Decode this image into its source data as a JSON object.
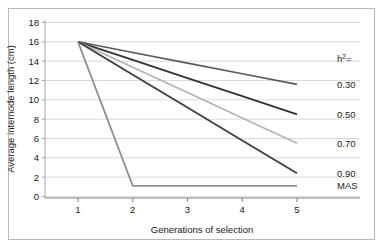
{
  "chart_data": {
    "type": "line",
    "title": "",
    "xlabel": "Generations of selection",
    "ylabel": "Average internode length (cm)",
    "x": [
      1,
      2,
      3,
      4,
      5
    ],
    "xticklabels": [
      "1",
      "2",
      "3",
      "4",
      "5"
    ],
    "yticklabels": [
      "0",
      "2",
      "4",
      "6",
      "8",
      "10",
      "12",
      "14",
      "16",
      "18"
    ],
    "xlim": [
      1,
      5
    ],
    "ylim": [
      0,
      18
    ],
    "grid": "horizontal",
    "legend_position": "right-inline",
    "legend_title": "h²=",
    "series": [
      {
        "name": "0.30",
        "label": "0.30",
        "color": "#595959",
        "width": 1.6,
        "values": [
          16.0,
          14.9,
          13.8,
          12.7,
          11.6
        ]
      },
      {
        "name": "0.50",
        "label": "0.50",
        "color": "#333333",
        "width": 1.8,
        "values": [
          16.0,
          14.125,
          12.25,
          10.375,
          8.5
        ]
      },
      {
        "name": "0.70",
        "label": "0.70",
        "color": "#b3b3b3",
        "width": 1.7,
        "values": [
          16.0,
          13.375,
          10.75,
          8.125,
          5.5
        ]
      },
      {
        "name": "0.90",
        "label": "0.90",
        "color": "#3d3d3d",
        "width": 1.8,
        "values": [
          16.0,
          12.6,
          9.2,
          5.8,
          2.4
        ]
      },
      {
        "name": "MAS",
        "label": "MAS",
        "color": "#8c8c8c",
        "width": 1.7,
        "values": [
          16.0,
          1.1,
          1.1,
          1.1,
          1.1
        ]
      }
    ]
  },
  "axes": {
    "y_title": "Average internode length (cm)",
    "x_title": "Generations of selection",
    "y_ticks": [
      "18",
      "16",
      "14",
      "12",
      "10",
      "8",
      "6",
      "4",
      "2",
      "0"
    ],
    "x_ticks": [
      "1",
      "2",
      "3",
      "4",
      "5"
    ]
  },
  "legend": {
    "header": "h",
    "header_sup": "2",
    "header_eq": "=",
    "entries": [
      "0.30",
      "0.50",
      "0.70",
      "0.90",
      "MAS"
    ]
  },
  "colors": {
    "grid": "#d9d9d9",
    "axis": "#808080",
    "frame": "#b8b8b8",
    "text": "#1a1a1a",
    "background": "#ffffff"
  }
}
